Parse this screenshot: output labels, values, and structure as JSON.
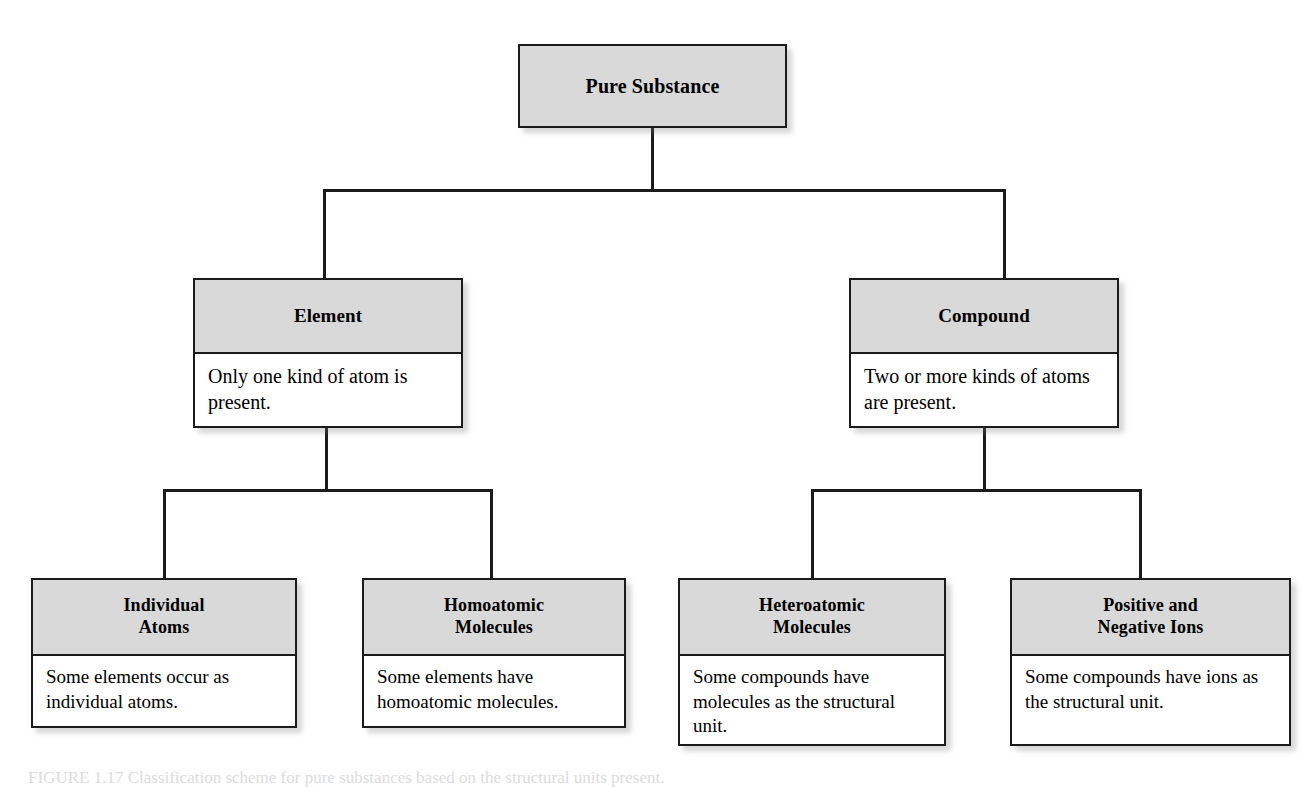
{
  "diagram": {
    "colors": {
      "header_fill": "#d9d9d9",
      "body_fill": "#ffffff",
      "border": "#1b1b1b",
      "page_background": "#ffffff"
    },
    "nodes": {
      "root": {
        "title": "Pure Substance",
        "description": ""
      },
      "element": {
        "title": "Element",
        "description": "Only one kind of atom is present."
      },
      "compound": {
        "title": "Compound",
        "description": "Two or more kinds of atoms are present."
      },
      "individual_atoms": {
        "title_line1": "Individual",
        "title_line2": "Atoms",
        "description": "Some elements occur as individual atoms."
      },
      "homoatomic_molecules": {
        "title_line1": "Homoatomic",
        "title_line2": "Molecules",
        "description": "Some elements have homoatomic molecules."
      },
      "heteroatomic_molecules": {
        "title_line1": "Heteroatomic",
        "title_line2": "Molecules",
        "description": "Some compounds have molecules as the structural unit."
      },
      "positive_negative_ions": {
        "title_line1": "Positive and",
        "title_line2": "Negative Ions",
        "description": "Some compounds have ions as the structural unit."
      }
    },
    "edges": [
      {
        "from": "root",
        "to": "element"
      },
      {
        "from": "root",
        "to": "compound"
      },
      {
        "from": "element",
        "to": "individual_atoms"
      },
      {
        "from": "element",
        "to": "homoatomic_molecules"
      },
      {
        "from": "compound",
        "to": "heteroatomic_molecules"
      },
      {
        "from": "compound",
        "to": "positive_negative_ions"
      }
    ]
  },
  "caption": {
    "label": "FIGURE 1.17",
    "text": "FIGURE 1.17  Classification scheme for pure substances based on the structural units present."
  }
}
